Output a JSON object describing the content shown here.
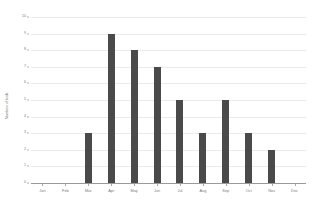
{
  "chart_data": {
    "type": "bar",
    "title": "",
    "subtitle": "",
    "xlabel": "",
    "ylabel": "Numbers of birds",
    "categories": [
      "Jan",
      "Feb",
      "Mar",
      "Apr",
      "May",
      "Jun",
      "Jul",
      "Aug",
      "Sep",
      "Oct",
      "Nov",
      "Dec"
    ],
    "values": [
      0,
      0,
      3,
      9,
      8,
      7,
      5,
      3,
      5,
      3,
      2,
      0
    ],
    "ylim": [
      0,
      10
    ],
    "ytick_labels": [
      "0",
      "1",
      "2",
      "3",
      "4",
      "5",
      "6",
      "7",
      "8",
      "9",
      "10"
    ],
    "ytick_values": [
      0,
      1,
      2,
      3,
      4,
      5,
      6,
      7,
      8,
      9,
      10
    ],
    "grid": true,
    "legend": false,
    "legend_position": "none",
    "colors": {
      "bar": "#4a4a4a",
      "gridline": "#ebebeb",
      "axis_line": "#9a9a9a",
      "tick_label": "#7d7d7d",
      "axis_title": "#6f6f6f",
      "background": "#ffffff"
    }
  }
}
